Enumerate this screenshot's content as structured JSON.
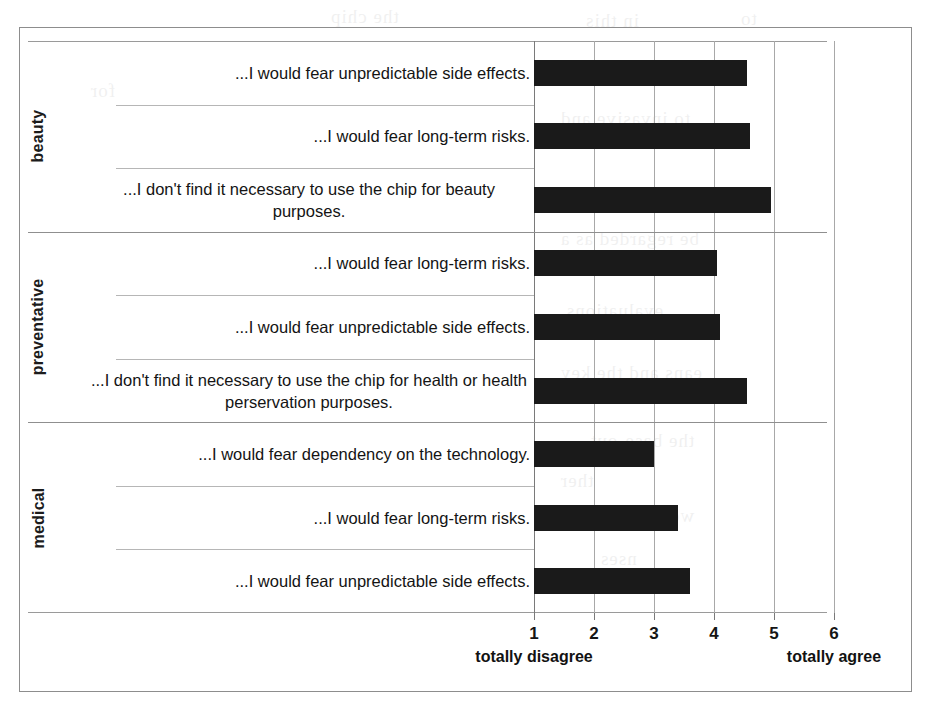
{
  "chart_data": {
    "type": "bar",
    "orientation": "horizontal",
    "title": "",
    "xlabel": "",
    "ylabel": "",
    "xlim": [
      1,
      6
    ],
    "xticks": [
      "1",
      "2",
      "3",
      "4",
      "5",
      "6"
    ],
    "scale_low_label": "totally disagree",
    "scale_high_label": "totally agree",
    "grid": true,
    "legend": "none",
    "bar_color": "#1a1a1a",
    "groups": [
      {
        "name": "beauty",
        "items": [
          {
            "label": "...I would fear unpredictable side effects.",
            "value": 4.55
          },
          {
            "label": "...I would fear long-term risks.",
            "value": 4.6
          },
          {
            "label": "...I don't find it necessary to use the chip for beauty purposes.",
            "value": 4.95
          }
        ]
      },
      {
        "name": "preventative",
        "items": [
          {
            "label": "...I would fear long-term risks.",
            "value": 4.05
          },
          {
            "label": "...I would fear unpredictable side effects.",
            "value": 4.1
          },
          {
            "label": "...I don't find it necessary to use the chip for health or health perservation purposes.",
            "value": 4.55
          }
        ]
      },
      {
        "name": "medical",
        "items": [
          {
            "label": "...I would fear dependency on the technology.",
            "value": 3.0
          },
          {
            "label": "...I would fear long-term risks.",
            "value": 3.4
          },
          {
            "label": "...I would fear unpredictable side effects.",
            "value": 3.6
          }
        ]
      }
    ]
  },
  "bleed_text": [
    {
      "text": "the chip",
      "x": 330,
      "y": 6
    },
    {
      "text": "in this",
      "x": 585,
      "y": 10
    },
    {
      "text": "to",
      "x": 740,
      "y": 8
    },
    {
      "text": "to invasive and",
      "x": 560,
      "y": 108
    },
    {
      "text": "for",
      "x": 90,
      "y": 80
    },
    {
      "text": "be independent of",
      "x": 560,
      "y": 185
    },
    {
      "text": "be regarded as a",
      "x": 560,
      "y": 228
    },
    {
      "text": "evaluations.",
      "x": 560,
      "y": 300
    },
    {
      "text": "eans and the key",
      "x": 560,
      "y": 362
    },
    {
      "text": "the base-out",
      "x": 590,
      "y": 430
    },
    {
      "text": "ther",
      "x": 560,
      "y": 470
    },
    {
      "text": "would show the",
      "x": 560,
      "y": 505
    },
    {
      "text": "nses",
      "x": 600,
      "y": 548
    }
  ]
}
